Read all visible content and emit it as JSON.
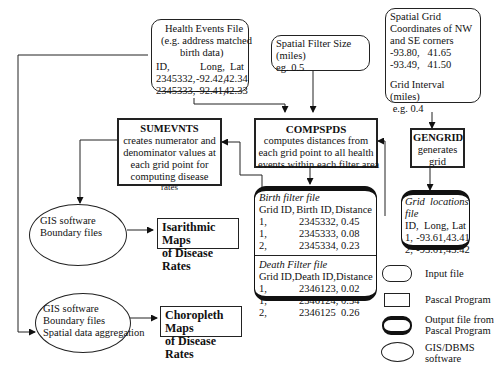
{
  "health_events_file": {
    "title": "Health Events File",
    "subtitle_1": "(e.g. address matched",
    "subtitle_2": "birth data)",
    "columns": [
      "ID,",
      "Long,",
      "Lat"
    ],
    "rows": [
      [
        "2345332,",
        "-92.42,",
        "42.34"
      ],
      [
        "2345333,",
        "-92.41,",
        "42.33"
      ]
    ]
  },
  "spatial_filter": {
    "line1": "Spatial Filter Size",
    "line2": "(miles)",
    "line3": "eg. 0.5"
  },
  "spatial_grid": {
    "line1": "Spatial Grid",
    "line2": "Coordinates of NW",
    "line3": "and SE corners",
    "coord1": "-93.80,   41.65",
    "coord2": "-93.49,   41.50",
    "interval1": "Grid Interval",
    "interval2": "(miles)",
    "interval3": " e.g. 0.4"
  },
  "sumevnts": {
    "name": "SUMEVNTS",
    "desc": [
      "creates numerator and",
      "denominator values at",
      "each grid point for",
      "computing disease",
      "rates"
    ]
  },
  "compspds": {
    "name": "COMPSPDS",
    "desc": [
      "computes distances from",
      "each grid point to all health",
      "events within each filter area"
    ]
  },
  "gengrid": {
    "name": "GENGRID",
    "desc": [
      "generates",
      "grid"
    ]
  },
  "birth_filter": {
    "title": "Birth filter file",
    "columns": [
      "Grid ID,",
      "Birth ID,",
      "Distance"
    ],
    "rows": [
      [
        "1,",
        "2345332,",
        "0.45"
      ],
      [
        "1,",
        "2345333,",
        "0.08"
      ],
      [
        "2,",
        "2345334,",
        "0.23"
      ]
    ]
  },
  "death_filter": {
    "title": "Death Filter file",
    "columns": [
      "Grid ID,",
      "Death ID,",
      "Distance"
    ],
    "rows": [
      [
        "1,",
        "2346123,",
        "0.02"
      ],
      [
        "1,",
        "2346124,",
        "0.34"
      ],
      [
        "2,",
        "2346125",
        "0.26"
      ]
    ]
  },
  "grid_locations": {
    "title1": "Grid  locations",
    "title2": "file",
    "columns": [
      "ID,",
      "Long,",
      "Lat"
    ],
    "rows": [
      [
        "1,",
        "-93.61,",
        "43.41"
      ],
      [
        "2,",
        "-93.61,",
        "43.42"
      ]
    ]
  },
  "gis_isarithmic": {
    "line1": "GIS software",
    "line2": "Boundary files"
  },
  "gis_choropleth": {
    "line1": "GIS software",
    "line2": "Boundary files",
    "line3": "Spatial data aggregation"
  },
  "isarithmic_maps": {
    "line1": "Isarithmic Maps",
    "line2": "of Disease Rates"
  },
  "choropleth_maps": {
    "line1": "Choropleth Maps",
    "line2": "of Disease Rates"
  },
  "legend": [
    {
      "shape": "input-file",
      "label1": "Input file",
      "label2": ""
    },
    {
      "shape": "program",
      "label1": "Pascal Program",
      "label2": ""
    },
    {
      "shape": "output-file",
      "label1": "Output file from",
      "label2": "Pascal Program"
    },
    {
      "shape": "ellipse",
      "label1": "GIS/DBMS",
      "label2": "software"
    }
  ]
}
